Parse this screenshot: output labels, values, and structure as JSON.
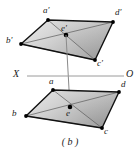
{
  "figure": {
    "caption": "( b )",
    "caption_position": {
      "x": 70,
      "y": 141
    },
    "canvas": {
      "width": 140,
      "height": 157,
      "background": "#ffffff"
    },
    "style": {
      "outline_color": "#111111",
      "outline_width": 1.4,
      "diagonal_color": "#4a4a4a",
      "diagonal_width": 0.7,
      "fill_light": "#e8e8e8",
      "fill_mid": "#c9c9c9",
      "fill_dark": "#9d9d9d",
      "vertex_dot_color": "#000000",
      "vertex_dot_radius": 1.9,
      "axis_color": "#9a9a9a",
      "axis_width": 1.0,
      "projector_color": "#8a8a8a",
      "projector_width": 1.0
    },
    "axis": {
      "name": "ground-line",
      "left_label": "X",
      "right_label": "O",
      "y": 76,
      "x_start": 27,
      "x_end": 124,
      "left_label_position": {
        "x": 14,
        "y": 70
      },
      "right_label_position": {
        "x": 126,
        "y": 70
      }
    },
    "projector": {
      "name": "vertical-projector",
      "from": {
        "x": 66,
        "y": 35
      },
      "to": {
        "x": 70,
        "y": 107
      }
    },
    "shapes": [
      {
        "id": "upper-parallelogram",
        "name": "Upper parallelogram a'b'c'd'",
        "center_label": "e'",
        "center": {
          "x": 66,
          "y": 35
        },
        "center_label_position": {
          "x": 62,
          "y": 25
        },
        "vertices": [
          {
            "label": "a'",
            "x": 48,
            "y": 20,
            "label_x": 43,
            "label_y": 8
          },
          {
            "label": "d'",
            "x": 113,
            "y": 22,
            "label_x": 115,
            "label_y": 10
          },
          {
            "label": "c'",
            "x": 95,
            "y": 60,
            "label_x": 97,
            "label_y": 60
          },
          {
            "label": "b'",
            "x": 21,
            "y": 44,
            "label_x": 6,
            "label_y": 37
          }
        ]
      },
      {
        "id": "lower-parallelogram",
        "name": "Lower parallelogram abcd",
        "center_label": "e",
        "center": {
          "x": 70,
          "y": 107
        },
        "center_label_position": {
          "x": 66,
          "y": 110
        },
        "vertices": [
          {
            "label": "a",
            "x": 53,
            "y": 90,
            "label_x": 49,
            "label_y": 79
          },
          {
            "label": "d",
            "x": 119,
            "y": 92,
            "label_x": 121,
            "label_y": 82
          },
          {
            "label": "c",
            "x": 102,
            "y": 128,
            "label_x": 104,
            "label_y": 128
          },
          {
            "label": "b",
            "x": 26,
            "y": 116,
            "label_x": 12,
            "label_y": 110
          }
        ]
      }
    ]
  }
}
